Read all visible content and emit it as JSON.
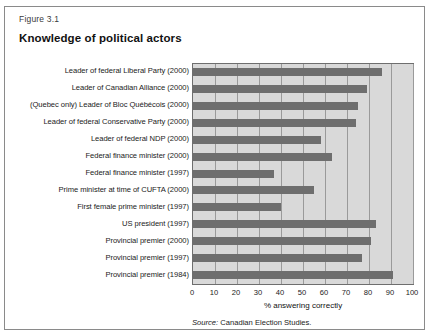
{
  "figure": {
    "number": "Figure 3.1",
    "title": "Knowledge of political actors",
    "source_prefix": "Source:",
    "source_text": "Canadian Election Studies."
  },
  "chart_data": {
    "type": "bar",
    "orientation": "horizontal",
    "title": "Knowledge of political actors",
    "xlabel": "% answering correctly",
    "ylabel": "",
    "xlim": [
      0,
      100
    ],
    "xticks": [
      0,
      10,
      20,
      30,
      40,
      50,
      60,
      70,
      80,
      90,
      100
    ],
    "grid": true,
    "legend": null,
    "bar_color": "#6e6e6e",
    "plot_background": "#d9d9d9",
    "categories": [
      "Leader of federal Liberal Party (2000)",
      "Leader of Canadian Alliance (2000)",
      "(Quebec only) Leader of Bloc Québécois (2000)",
      "Leader of federal Conservative Party (2000)",
      "Leader of federal NDP (2000)",
      "Federal finance minister (2000)",
      "Federal finance minister (1997)",
      "Prime minister at time of CUFTA (2000)",
      "First female prime minister (1997)",
      "US president (1997)",
      "Provincial premier (2000)",
      "Provincial premier (1997)",
      "Provincial premier (1984)"
    ],
    "values": [
      86,
      79,
      75,
      74,
      58,
      63,
      37,
      55,
      40,
      83,
      81,
      77,
      91
    ]
  }
}
